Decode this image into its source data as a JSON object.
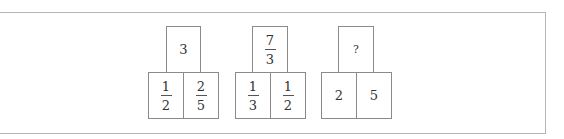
{
  "puzzle": {
    "groups": [
      {
        "top": {
          "type": "int",
          "value": "3"
        },
        "bottom": [
          {
            "type": "frac",
            "num": "1",
            "den": "2"
          },
          {
            "type": "frac",
            "num": "2",
            "den": "5"
          }
        ]
      },
      {
        "top": {
          "type": "frac",
          "num": "7",
          "den": "3"
        },
        "bottom": [
          {
            "type": "frac",
            "num": "1",
            "den": "3"
          },
          {
            "type": "frac",
            "num": "1",
            "den": "2"
          }
        ]
      },
      {
        "top": {
          "type": "unknown",
          "value": "?"
        },
        "bottom": [
          {
            "type": "int",
            "value": "2"
          },
          {
            "type": "int",
            "value": "5"
          }
        ]
      }
    ]
  }
}
